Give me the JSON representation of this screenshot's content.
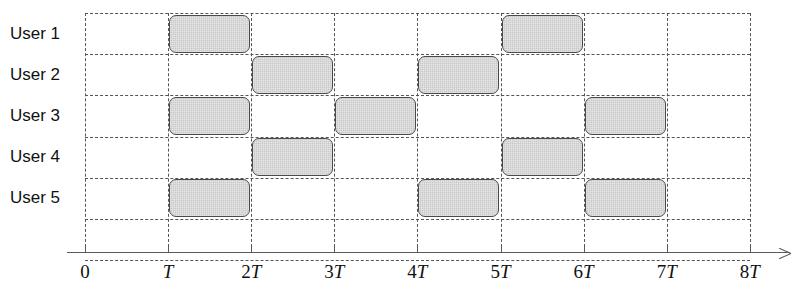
{
  "chart_data": {
    "type": "table",
    "title": "",
    "xlabel": "",
    "ylabel": "",
    "grid": true,
    "legend": "none",
    "x_tick_labels": [
      "0",
      "T",
      "2T",
      "3T",
      "4T",
      "5T",
      "6T",
      "7T",
      "8T"
    ],
    "x_tick_values": [
      0,
      1,
      2,
      3,
      4,
      5,
      6,
      7,
      8
    ],
    "xlim": [
      0,
      8
    ],
    "time_unit_symbol": "T",
    "categories": [
      "User 1",
      "User 2",
      "User 3",
      "User 4",
      "User 5"
    ],
    "series": [
      {
        "name": "User 1",
        "row": 0,
        "slots": [
          [
            1,
            2
          ],
          [
            5,
            6
          ]
        ]
      },
      {
        "name": "User 2",
        "row": 1,
        "slots": [
          [
            2,
            3
          ],
          [
            4,
            5
          ]
        ]
      },
      {
        "name": "User 3",
        "row": 2,
        "slots": [
          [
            1,
            2
          ],
          [
            3,
            4
          ],
          [
            6,
            7
          ]
        ]
      },
      {
        "name": "User 4",
        "row": 3,
        "slots": [
          [
            2,
            3
          ],
          [
            5,
            6
          ]
        ]
      },
      {
        "name": "User 5",
        "row": 4,
        "slots": [
          [
            1,
            2
          ],
          [
            4,
            5
          ],
          [
            6,
            7
          ]
        ]
      }
    ]
  },
  "rows": [
    {
      "label": "User 1"
    },
    {
      "label": "User 2"
    },
    {
      "label": "User 3"
    },
    {
      "label": "User 4"
    },
    {
      "label": "User 5"
    }
  ],
  "axis": {
    "ticks": [
      {
        "number": "",
        "symbol": "",
        "text": "0"
      },
      {
        "number": "",
        "symbol": "T",
        "text": "T"
      },
      {
        "number": "2",
        "symbol": "T",
        "text": "2T"
      },
      {
        "number": "3",
        "symbol": "T",
        "text": "3T"
      },
      {
        "number": "4",
        "symbol": "T",
        "text": "4T"
      },
      {
        "number": "5",
        "symbol": "T",
        "text": "5T"
      },
      {
        "number": "6",
        "symbol": "T",
        "text": "6T"
      },
      {
        "number": "7",
        "symbol": "T",
        "text": "7T"
      },
      {
        "number": "8",
        "symbol": "T",
        "text": "8T"
      }
    ],
    "zero_label": "0"
  },
  "colors": {
    "block_fill": "#c9c9c9",
    "block_border": "#4a4a4a",
    "grid": "#555555",
    "axis": "#5a5a5a",
    "text": "#111111"
  }
}
